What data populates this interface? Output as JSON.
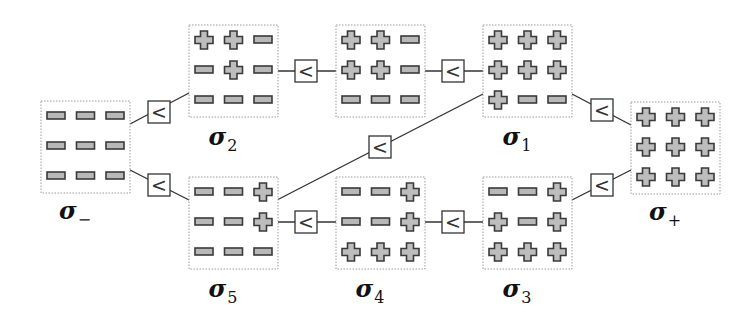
{
  "diagram": {
    "type": "lattice-of-configurations",
    "relation_symbol": "<",
    "states": [
      {
        "id": "sigma_minus",
        "label": "σ",
        "subscript": "−",
        "grid": [
          [
            "-",
            "-",
            "-"
          ],
          [
            "-",
            "-",
            "-"
          ],
          [
            "-",
            "-",
            "-"
          ]
        ]
      },
      {
        "id": "sigma_2",
        "label": "σ",
        "subscript": "2",
        "grid": [
          [
            "+",
            "+",
            "-"
          ],
          [
            "-",
            "+",
            "-"
          ],
          [
            "-",
            "-",
            "-"
          ]
        ]
      },
      {
        "id": "sigma_5",
        "label": "σ",
        "subscript": "5",
        "grid": [
          [
            "-",
            "-",
            "+"
          ],
          [
            "-",
            "-",
            "+"
          ],
          [
            "-",
            "-",
            "-"
          ]
        ]
      },
      {
        "id": "sigma_top_mid",
        "label": "",
        "subscript": "",
        "grid": [
          [
            "+",
            "+",
            "-"
          ],
          [
            "+",
            "+",
            "-"
          ],
          [
            "-",
            "-",
            "-"
          ]
        ]
      },
      {
        "id": "sigma_4",
        "label": "σ",
        "subscript": "4",
        "grid": [
          [
            "-",
            "-",
            "+"
          ],
          [
            "-",
            "-",
            "+"
          ],
          [
            "+",
            "+",
            "+"
          ]
        ]
      },
      {
        "id": "sigma_1",
        "label": "σ",
        "subscript": "1",
        "grid": [
          [
            "+",
            "+",
            "+"
          ],
          [
            "+",
            "+",
            "+"
          ],
          [
            "+",
            "-",
            "-"
          ]
        ]
      },
      {
        "id": "sigma_3",
        "label": "σ",
        "subscript": "3",
        "grid": [
          [
            "-",
            "-",
            "+"
          ],
          [
            "+",
            "-",
            "+"
          ],
          [
            "+",
            "+",
            "+"
          ]
        ]
      },
      {
        "id": "sigma_plus",
        "label": "σ",
        "subscript": "+",
        "grid": [
          [
            "+",
            "+",
            "+"
          ],
          [
            "+",
            "+",
            "+"
          ],
          [
            "+",
            "+",
            "+"
          ]
        ]
      }
    ],
    "relations": [
      {
        "from": "sigma_minus",
        "to": "sigma_2",
        "symbol": "<"
      },
      {
        "from": "sigma_minus",
        "to": "sigma_5",
        "symbol": "<"
      },
      {
        "from": "sigma_2",
        "to": "sigma_top_mid",
        "symbol": "<"
      },
      {
        "from": "sigma_top_mid",
        "to": "sigma_1",
        "symbol": "<"
      },
      {
        "from": "sigma_5",
        "to": "sigma_1",
        "symbol": "<"
      },
      {
        "from": "sigma_5",
        "to": "sigma_4",
        "symbol": "<"
      },
      {
        "from": "sigma_4",
        "to": "sigma_3",
        "symbol": "<"
      },
      {
        "from": "sigma_1",
        "to": "sigma_plus",
        "symbol": "<"
      },
      {
        "from": "sigma_3",
        "to": "sigma_plus",
        "symbol": "<"
      }
    ]
  },
  "colors": {
    "symbol_fill": "#bdbdbd",
    "symbol_stroke": "#3a3a3a",
    "edge": "#333333",
    "box_border": "#9a9a9a"
  }
}
